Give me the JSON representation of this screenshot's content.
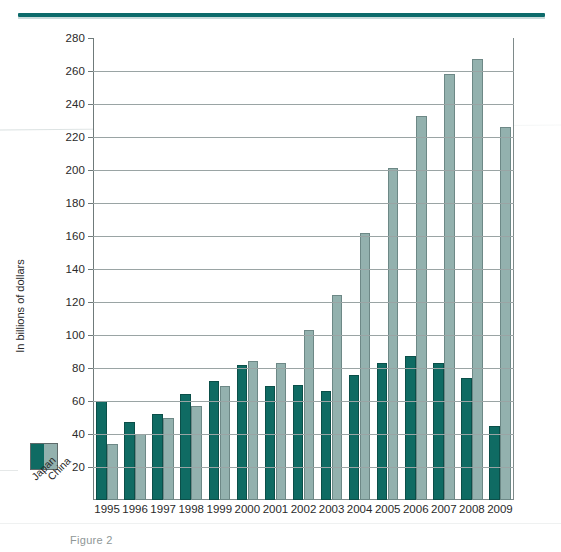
{
  "figure": {
    "y_axis_title": "In billions of dollars",
    "caption": "Figure 2",
    "legend": {
      "japan_label": "Japan",
      "china_label": "China",
      "japan_color": "#0f6b63",
      "china_color": "#93b1ae"
    }
  },
  "chart_data": {
    "type": "bar",
    "title": "",
    "xlabel": "",
    "ylabel": "In billions of dollars",
    "ylim": [
      0,
      280
    ],
    "ytick_values": [
      20,
      40,
      60,
      80,
      100,
      120,
      140,
      160,
      180,
      200,
      220,
      240,
      260,
      280
    ],
    "ytick_labels": [
      "20",
      "40",
      "60",
      "80",
      "100",
      "120",
      "140",
      "160",
      "180",
      "200",
      "220",
      "240",
      "260",
      "280"
    ],
    "grid": true,
    "legend_position": "outside-left-bottom",
    "categories": [
      "1995",
      "1996",
      "1997",
      "1998",
      "1999",
      "2000",
      "2001",
      "2002",
      "2003",
      "2004",
      "2005",
      "2006",
      "2007",
      "2008",
      "2009"
    ],
    "series": [
      {
        "name": "Japan",
        "color": "#0f6b63",
        "values": [
          60,
          47,
          52,
          64,
          72,
          82,
          69,
          70,
          66,
          76,
          83,
          87,
          83,
          74,
          45
        ]
      },
      {
        "name": "China",
        "color": "#93b1ae",
        "values": [
          34,
          40,
          50,
          57,
          69,
          84,
          83,
          103,
          124,
          162,
          201,
          233,
          258,
          267,
          226
        ]
      }
    ]
  }
}
